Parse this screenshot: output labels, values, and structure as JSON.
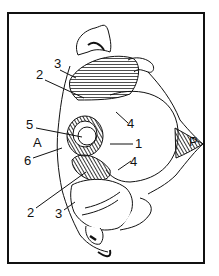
{
  "figure": {
    "labels": {
      "top_3": "3",
      "top_2": "2",
      "top_4": "4",
      "label_5": "5",
      "label_A": "A",
      "label_6": "6",
      "label_1": "1",
      "label_P": "P",
      "lower_4": "4",
      "bottom_2": "2",
      "bottom_3": "3"
    },
    "colors": {
      "ink": "#111111",
      "background": "#ffffff"
    }
  }
}
